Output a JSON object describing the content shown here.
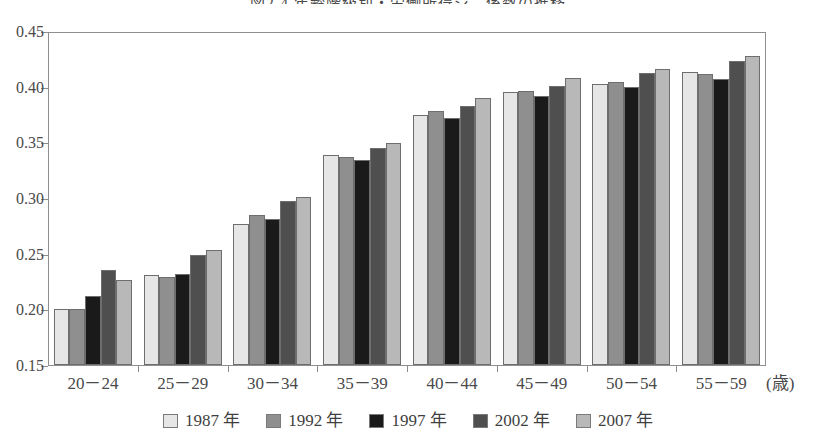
{
  "chart_data": {
    "type": "bar",
    "title": "図2-4 年齢階級別・労働所得ジニ係数の推移",
    "xlabel": "(歳)",
    "ylabel": "",
    "categories": [
      "20－24",
      "25－29",
      "30－34",
      "35－39",
      "40－44",
      "45－49",
      "50－54",
      "55－59"
    ],
    "series": [
      {
        "name": "1987 年",
        "color": "#e6e6e6",
        "values": [
          0.2,
          0.231,
          0.277,
          0.339,
          0.375,
          0.395,
          0.402,
          0.413
        ]
      },
      {
        "name": "1992 年",
        "color": "#8f8f8f",
        "values": [
          0.2,
          0.229,
          0.285,
          0.337,
          0.378,
          0.396,
          0.404,
          0.411
        ]
      },
      {
        "name": "1997 年",
        "color": "#1a1a1a",
        "values": [
          0.212,
          0.232,
          0.281,
          0.334,
          0.372,
          0.392,
          0.4,
          0.407
        ]
      },
      {
        "name": "2002 年",
        "color": "#4f4f4f",
        "values": [
          0.235,
          0.249,
          0.297,
          0.345,
          0.383,
          0.401,
          0.412,
          0.423
        ]
      },
      {
        "name": "2007 年",
        "color": "#b8b8b8",
        "values": [
          0.226,
          0.253,
          0.301,
          0.349,
          0.39,
          0.408,
          0.416,
          0.428
        ]
      }
    ],
    "ylim": [
      0.15,
      0.45
    ],
    "y_ticks": [
      "0.45",
      "0.40",
      "0.35",
      "0.30",
      "0.25",
      "0.20",
      "0.15"
    ],
    "y_tick_values": [
      0.45,
      0.4,
      0.35,
      0.3,
      0.25,
      0.2,
      0.15
    ],
    "grid": false,
    "legend_position": "bottom",
    "bar_border_color": "#6e6e6e",
    "axis_color": "#8e8e8e"
  }
}
